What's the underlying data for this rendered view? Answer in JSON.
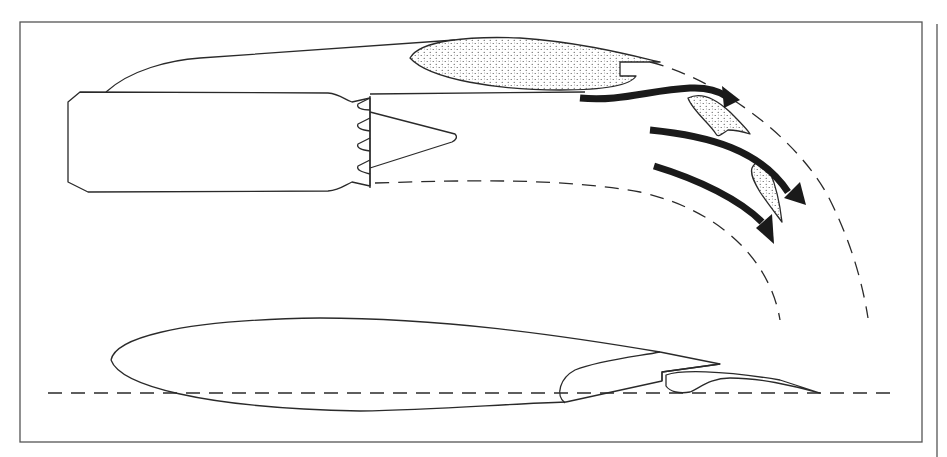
{
  "canvas": {
    "width": 947,
    "height": 457,
    "background": "#ffffff"
  },
  "colors": {
    "ink": "#2a2a2a",
    "arrow": "#1a1a1a",
    "stipple_bg": "#ffffff",
    "stipple_dot": "#444444"
  },
  "frame": {
    "outer_rect": {
      "x": 20,
      "y": 22,
      "w": 902,
      "h": 420
    },
    "right_rule": {
      "x": 937,
      "y1": 24,
      "y2": 457
    }
  },
  "engine": {
    "nacelle_top_curve": "M106,92 C130,70 170,60 200,58 L455,40",
    "core_body": "M68,102 L80,92 L328,93 C340,94 345,100 352,102 L370,98 L370,186 L352,182 C345,185 340,190 328,191 L88,192 L68,182 Z",
    "mixer_lobes": [
      "M370,98 L358,104 C356,108 362,110 370,110",
      "M370,118 L358,124 C356,128 362,130 370,131",
      "M370,138 L358,144 C356,148 362,150 370,151",
      "M370,160 L358,166 C356,170 362,172 370,174"
    ],
    "exit_plane": "M370,96 L370,188",
    "plug_cone": "M370,112 L455,134 C458,137 456,140 452,142 L370,168",
    "bypass_duct_line": "M370,94 L585,92",
    "jet_boundary_lower": "M375,183 C470,180 560,178 640,192 C720,210 770,260 780,320",
    "jet_boundary_upper": "M650,62 C720,80 800,140 830,200 C850,240 862,280 868,318"
  },
  "flaps": [
    {
      "name": "upper-flap",
      "d": "M410,58 C420,40 470,36 520,38 C580,42 630,55 660,62 L620,62 L620,76 L636,76 C630,86 600,90 560,90 C500,90 430,80 410,58 Z"
    },
    {
      "name": "vane-1",
      "d": "M688,98 C700,92 715,98 730,112 C740,122 748,130 750,134 C744,132 736,130 728,130 C722,134 718,138 716,134 C710,124 692,110 688,98 Z"
    },
    {
      "name": "vane-2",
      "d": "M752,168 C756,160 764,160 770,172 C776,186 780,205 782,222 C776,214 768,204 760,192 C754,182 750,174 752,168 Z"
    }
  ],
  "flow_arrows": [
    {
      "name": "flow-arrow-1",
      "d": "M580,98 C620,102 650,90 690,88 C710,87 720,92 726,96",
      "head": "740,100 722,86 724,108"
    },
    {
      "name": "flow-arrow-2",
      "d": "M650,130 C710,136 760,150 788,192",
      "head": "806,205 784,198 800,182"
    },
    {
      "name": "flow-arrow-3",
      "d": "M654,166 C700,180 740,200 762,222",
      "head": "774,244 756,228 772,214"
    }
  ],
  "wing_section": {
    "main_body": "M215,356 C200,350 108,330 110,360 C112,380 170,405 320,410 C400,412 470,404 565,402 L565,395 C570,360 620,355 660,352 L720,364 L660,370 L662,381 C640,380 620,378 615,370",
    "upper_surface": "M111,360 C115,340 170,320 320,318 C440,318 560,335 660,352",
    "lower_surface": "M111,360 C120,385 200,408 360,411 C440,410 500,404 566,402",
    "slat": "M565,403 C555,395 560,378 575,370 C600,360 640,356 660,352",
    "flap_body": "M662,381 L662,372 L720,364 M666,375 C680,370 720,370 780,380 L820,393 C790,385 760,378 730,378 C710,378 700,388 690,392 C680,394 670,392 666,386 Z",
    "chord_line": {
      "x1": 48,
      "y1": 393,
      "x2": 895,
      "y2": 393
    }
  }
}
